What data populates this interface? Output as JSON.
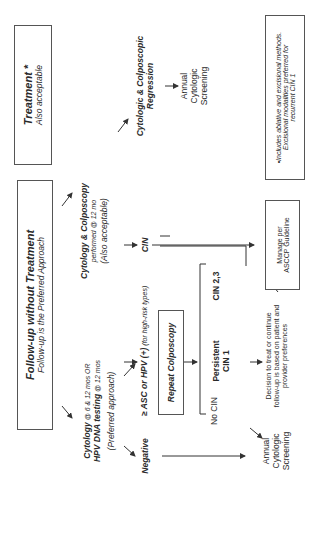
{
  "diagram": {
    "rotation_deg": -90,
    "treatment_box": {
      "title": "Treatment *",
      "subtitle": "Also acceptable"
    },
    "followup_box": {
      "title": "Follow-up without Treatment",
      "subtitle": "Follow-up is the Preferred Approach"
    },
    "cytology_hpv": {
      "line1_bold": "Cytology",
      "line1_rest": " @ 6 & 12 mos OR",
      "line2_bold": "HPV DNA testing",
      "line2_rest": " @ 12 mos",
      "line3": "(Preferred approach)"
    },
    "cytology_colposcopy": {
      "line1": "Cytology & Colposcopy",
      "line2": "performed @ 12 mo",
      "line3": "(Also acceptable)"
    },
    "regression": {
      "line1": "Cytologic & Colposcopic",
      "line2": "Regression"
    },
    "annual_top": {
      "line1": "Annual",
      "line2": "Cytologic",
      "line3": "Screening"
    },
    "annual_bottom": {
      "line1": "Annual",
      "line2": "Cytologic",
      "line3": "Screening"
    },
    "cin_label": "CIN",
    "negative_label": "Negative",
    "asc_hpv": {
      "main": "≥ ASC or HPV (+)",
      "note": " (for high-risk types)"
    },
    "repeat_colposcopy": "Repeat Colposcopy",
    "no_cin": "No CIN",
    "persistent_cin1": {
      "line1": "Persistent",
      "line2": "CIN 1"
    },
    "cin23": "CIN 2,3",
    "manage_box": {
      "line1": "Manage per",
      "line2": "ASCCP Guideline"
    },
    "decision_text": {
      "line1": "Decision to treat or continue",
      "line2": "follow-up is based on patient and",
      "line3": "provider preferences"
    },
    "footnote_box": {
      "line1": "•Includes ablative and excisional methods.",
      "line2": "Excisional modalities preferred for",
      "line3": "recurrent CIN 1"
    },
    "colors": {
      "line": "#333333",
      "text": "#2a2a2a",
      "border": "#555555"
    }
  }
}
